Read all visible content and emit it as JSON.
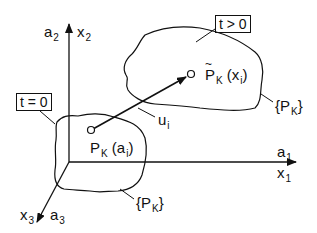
{
  "figure": {
    "type": "continuum-mechanics reference/current configuration diagram",
    "axes": {
      "vertical": {
        "labels": [
          "a",
          "x"
        ],
        "subscript": "2"
      },
      "horizontal": {
        "labels": [
          "a",
          "x"
        ],
        "subscript": "1"
      },
      "depth": {
        "labels": [
          "x",
          "a"
        ],
        "subscript": "3"
      }
    },
    "labels": {
      "a2": "a",
      "a2_sub": "2",
      "x2": "x",
      "x2_sub": "2",
      "a1": "a",
      "a1_sub": "1",
      "x1": "x",
      "x1_sub": "1",
      "x3": "x",
      "x3_sub": "3",
      "a3": "a",
      "a3_sub": "3",
      "t0_box": "t = 0",
      "tpos_box": "t > 0",
      "pk_point": "P",
      "pk_point_sub": "K",
      "pk_point_arg": "(a",
      "pk_point_arg_sub": "i",
      "pk_point_close": ")",
      "pkt_point": "P",
      "pkt_point_sub": "K",
      "pkt_point_arg": "(x",
      "pkt_point_arg_sub": "i",
      "pkt_point_close": ")",
      "displacement": "u",
      "displacement_sub": "i",
      "body_ref": "{P",
      "body_ref_sub": "K",
      "body_ref_close": "}",
      "body_cur": "{P",
      "body_cur_sub": "K",
      "body_cur_close": "}"
    },
    "colors": {
      "ink": "#111111",
      "background": "#ffffff"
    }
  }
}
